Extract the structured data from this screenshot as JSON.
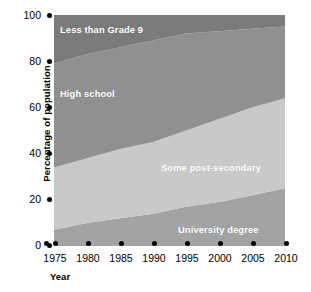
{
  "chart_data": {
    "type": "area",
    "stacked": true,
    "title": "",
    "xlabel": "Year",
    "ylabel": "Percentage of population",
    "x": [
      1975,
      1980,
      1985,
      1990,
      1995,
      2000,
      2005,
      2010
    ],
    "xlim": [
      1975,
      2010
    ],
    "ylim": [
      0,
      100
    ],
    "xticks": [
      "1975",
      "1980",
      "1985",
      "1990",
      "1995",
      "2000",
      "2005",
      "2010"
    ],
    "yticks": [
      "0",
      "20",
      "40",
      "60",
      "80",
      "100"
    ],
    "grid": false,
    "legend_position": "inline-area-labels",
    "series": [
      {
        "name": "University degree",
        "color": "#a3a3a3",
        "values": [
          7,
          10,
          12,
          14,
          17,
          19,
          22,
          25
        ]
      },
      {
        "name": "Some post-secondary",
        "color": "#c9c9c9",
        "values": [
          27,
          28,
          30,
          31,
          33,
          36,
          38,
          39
        ]
      },
      {
        "name": "High school",
        "color": "#909090",
        "values": [
          45,
          45,
          44,
          44,
          42,
          38,
          34,
          31
        ]
      },
      {
        "name": "Less than Grade 9",
        "color": "#7b7b7b",
        "values": [
          21,
          17,
          14,
          11,
          8,
          7,
          6,
          5
        ]
      }
    ],
    "cumulative_tops": {
      "University degree": [
        7,
        10,
        12,
        14,
        17,
        19,
        22,
        25
      ],
      "Some post-secondary": [
        34,
        38,
        42,
        45,
        50,
        55,
        60,
        64
      ],
      "High school": [
        79,
        83,
        86,
        89,
        92,
        93,
        94,
        95
      ],
      "Less than Grade 9": [
        100,
        100,
        100,
        100,
        100,
        100,
        100,
        100
      ]
    },
    "annotations": [
      {
        "text": "Less than Grade 9",
        "series": "Less than Grade 9"
      },
      {
        "text": "High school",
        "series": "High school"
      },
      {
        "text": "Some post-secondary",
        "series": "Some post-secondary"
      },
      {
        "text": "University degree",
        "series": "University degree"
      }
    ]
  },
  "axes": {
    "y_title": "Percentage of population",
    "x_title": "Year",
    "y_tick_labels": [
      "100",
      "80",
      "60",
      "40",
      "20",
      "0"
    ],
    "x_tick_labels": [
      "1975",
      "1980",
      "1985",
      "1990",
      "1995",
      "2000",
      "2005",
      "2010"
    ]
  },
  "colors": {
    "less_than_grade_9": "#7b7b7b",
    "high_school": "#909090",
    "some_post_secondary": "#c9c9c9",
    "university_degree": "#a3a3a3",
    "background": "#ffffff",
    "ink": "#000000",
    "label_text": "#ffffff"
  }
}
